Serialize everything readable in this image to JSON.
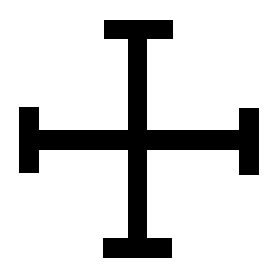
{
  "figure": {
    "background_color": "#ffffff",
    "fill_color": "#000000",
    "parts": {
      "top_bar": {
        "x": 104,
        "y": 20,
        "w": 69,
        "h": 19
      },
      "vertical_stem": {
        "x": 128,
        "y": 38,
        "w": 19,
        "h": 201
      },
      "horizontal_arm": {
        "x": 38,
        "y": 130,
        "w": 202,
        "h": 20
      },
      "left_bar": {
        "x": 19,
        "y": 107,
        "w": 20,
        "h": 66
      },
      "right_bar": {
        "x": 239,
        "y": 108,
        "w": 20,
        "h": 67
      },
      "bottom_bar": {
        "x": 103,
        "y": 238,
        "w": 69,
        "h": 20
      }
    }
  }
}
